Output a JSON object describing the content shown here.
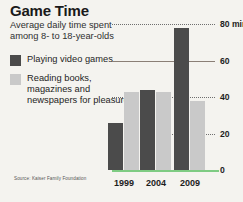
{
  "header": {
    "title": "Game Time",
    "subtitle": "Average daily time spent among 8- to 18-year-olds"
  },
  "legend": {
    "items": [
      {
        "label": "Playing video games",
        "color": "#4b4b4b"
      },
      {
        "label": "Reading books, magazines and newspapers for pleasure",
        "color": "#c9c9c9"
      }
    ]
  },
  "source": "Source: Kaiser Family Foundation",
  "colors": {
    "background": "#f4f3ef",
    "video_games": "#4b4b4b",
    "reading": "#c9c9c9",
    "baseline": "#7ecb83",
    "gridline_solid": "#8a7f76",
    "gridline_dotted": "#6e6e6e"
  },
  "chart_data": {
    "type": "bar",
    "title": "Game Time",
    "subtitle": "Average daily time spent among 8- to 18-year-olds",
    "categories": [
      "1999",
      "2004",
      "2009"
    ],
    "series": [
      {
        "name": "Playing video games",
        "values": [
          26,
          44,
          78
        ],
        "color": "#4b4b4b"
      },
      {
        "name": "Reading books, magazines and newspapers for pleasure",
        "values": [
          43,
          43,
          38
        ],
        "color": "#c9c9c9"
      }
    ],
    "xlabel": "",
    "ylabel": "minutes",
    "ylim": [
      0,
      80
    ],
    "yticks": [
      0,
      20,
      40,
      60,
      80
    ],
    "ytick_labels": [
      "0",
      "20",
      "40",
      "60",
      "80 minutes"
    ],
    "gridlines": [
      {
        "value": 80,
        "style": "dotted"
      },
      {
        "value": 60,
        "style": "solid"
      },
      {
        "value": 40,
        "style": "dotted"
      },
      {
        "value": 20,
        "style": "dotted"
      },
      {
        "value": 0,
        "style": "baseline"
      }
    ],
    "grid": true,
    "legend_position": "left",
    "annotation": "80 minutes",
    "source": "Source: Kaiser Family Foundation"
  }
}
